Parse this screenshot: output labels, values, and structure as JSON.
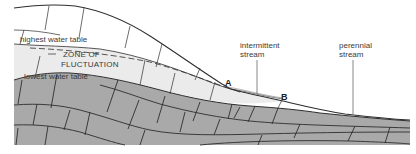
{
  "diagram": {
    "type": "geologic-cross-section",
    "labels": {
      "highest_water_table": "highest water table",
      "zone_line1": "ZONE OF",
      "zone_line2": "FLUCTUATION",
      "lowest_water_table": "lowest water table",
      "intermittent_line1": "intermittent",
      "intermittent_line2": "stream",
      "perennial_line1": "perennial",
      "perennial_line2": "stream",
      "point_a": "A",
      "point_b": "B"
    },
    "colors": {
      "background": "#ffffff",
      "unsaturated_zone": "#ffffff",
      "zone_of_fluctuation": "#ebebeb",
      "bedrock_saturated": "#a9a9a9",
      "lines": "#2e2e2e",
      "label_text": "#3a3a3a"
    }
  }
}
